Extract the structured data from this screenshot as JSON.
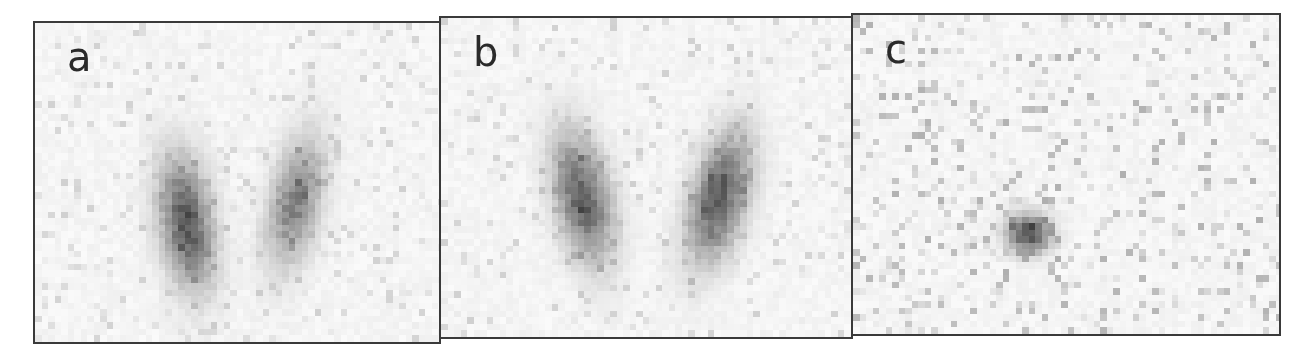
{
  "figure": {
    "background": "#ffffff",
    "border_color": "#3a3a3a",
    "panels": [
      {
        "label": "a",
        "x": 33,
        "y": 21,
        "w": 408,
        "h": 323,
        "blobs": [
          {
            "cx": 148,
            "cy": 195,
            "rx": 32,
            "ry": 82,
            "rot": -8,
            "intensity": 0.75,
            "dark_cy": 205
          },
          {
            "cx": 257,
            "cy": 175,
            "rx": 30,
            "ry": 82,
            "rot": 12,
            "intensity": 0.55,
            "dark_cy": 190
          }
        ]
      },
      {
        "label": "b",
        "x": 439,
        "y": 16,
        "w": 414,
        "h": 323,
        "blobs": [
          {
            "cx": 138,
            "cy": 175,
            "rx": 33,
            "ry": 82,
            "rot": -12,
            "intensity": 0.72,
            "dark_cy": 190
          },
          {
            "cx": 275,
            "cy": 175,
            "rx": 33,
            "ry": 82,
            "rot": 15,
            "intensity": 0.75,
            "dark_cy": 195
          }
        ]
      },
      {
        "label": "c",
        "x": 851,
        "y": 13,
        "w": 430,
        "h": 323,
        "blobs": [
          {
            "cx": 172,
            "cy": 215,
            "rx": 26,
            "ry": 25,
            "rot": 0,
            "intensity": 0.8,
            "dark_cy": 215
          }
        ],
        "noise": "high"
      }
    ]
  }
}
